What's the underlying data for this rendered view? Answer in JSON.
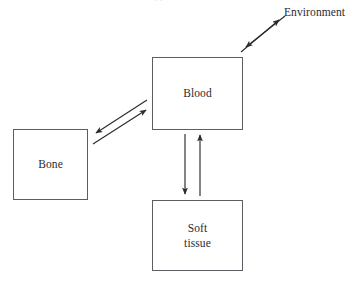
{
  "figure": {
    "type": "compartment-flow-diagram",
    "background_color": "#ffffff",
    "stroke_color": "#5d5d63",
    "text_color": "#2b2b2f",
    "caption_remnant": "clipped text line"
  },
  "nodes": [
    {
      "id": "blood",
      "label": "Blood",
      "shape": "rectangle",
      "x": 152,
      "y": 57,
      "width": 91,
      "height": 73
    },
    {
      "id": "bone",
      "label": "Bone",
      "shape": "rectangle",
      "x": 13,
      "y": 129,
      "width": 75,
      "height": 71
    },
    {
      "id": "soft_tissue",
      "label": "Soft\ntissue",
      "label_line1": "Soft",
      "label_line2": "tissue",
      "shape": "rectangle",
      "x": 152,
      "y": 200,
      "width": 91,
      "height": 71
    },
    {
      "id": "environment",
      "label": "Environment",
      "shape": "none",
      "x": 284,
      "y": 6,
      "width": 0,
      "height": 0
    }
  ],
  "edges": [
    {
      "id": "blood-environment",
      "from": "blood",
      "to": "environment",
      "direction": "bidirectional",
      "style": "two-parallel-single-headed-arrows",
      "orientation": "diagonal-up-right"
    },
    {
      "id": "blood-bone",
      "from": "blood",
      "to": "bone",
      "direction": "bidirectional",
      "style": "two-parallel-single-headed-arrows",
      "orientation": "diagonal-down-left"
    },
    {
      "id": "blood-soft",
      "from": "blood",
      "to": "soft_tissue",
      "direction": "bidirectional",
      "style": "two-parallel-single-headed-arrows",
      "orientation": "vertical"
    }
  ]
}
